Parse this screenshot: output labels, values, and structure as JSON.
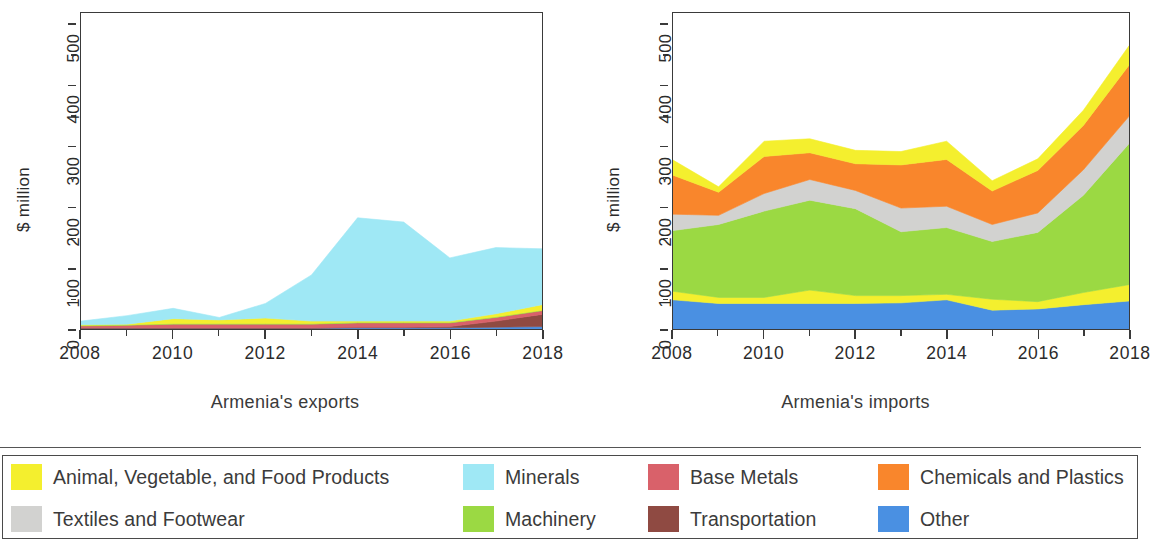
{
  "axis": {
    "ylabel": "$ million",
    "yticks": [
      "0",
      "100",
      "200",
      "300",
      "400",
      "500"
    ],
    "xticks": [
      "2008",
      "2010",
      "2012",
      "2014",
      "2016",
      "2018"
    ],
    "ylim": [
      0,
      520
    ],
    "xlim": [
      2008,
      2018
    ]
  },
  "panels": [
    {
      "id": "exports",
      "caption": "Armenia's exports"
    },
    {
      "id": "imports",
      "caption": "Armenia's imports"
    }
  ],
  "legend": {
    "items": [
      {
        "label": "Animal, Vegetable, and Food Products",
        "color": "#f4ef2e",
        "key": "food"
      },
      {
        "label": "Minerals",
        "color": "#9fe8f5",
        "key": "minerals"
      },
      {
        "label": "Base Metals",
        "color": "#d9616a",
        "key": "base_metals"
      },
      {
        "label": "Chemicals and Plastics",
        "color": "#f9862c",
        "key": "chemicals"
      },
      {
        "label": "Textiles and Footwear",
        "color": "#d2d2d0",
        "key": "textiles"
      },
      {
        "label": "Machinery",
        "color": "#9bd943",
        "key": "machinery"
      },
      {
        "label": "Transportation",
        "color": "#8f4a42",
        "key": "transportation"
      },
      {
        "label": "Other",
        "color": "#4a90e2",
        "key": "other"
      }
    ]
  },
  "chart_data": [
    {
      "type": "area",
      "title": "Armenia's exports",
      "stacked": true,
      "xlabel": "",
      "ylabel": "$ million",
      "ylim": [
        0,
        520
      ],
      "grid": false,
      "legend_position": "below-figure",
      "x": [
        2008,
        2009,
        2010,
        2011,
        2012,
        2013,
        2014,
        2015,
        2016,
        2017,
        2018
      ],
      "series": [
        {
          "name": "Other",
          "color": "#4a90e2",
          "values": [
            1,
            1,
            1,
            1,
            1,
            1,
            2,
            2,
            2,
            3,
            4
          ]
        },
        {
          "name": "Transportation",
          "color": "#8f4a42",
          "values": [
            1,
            1,
            1,
            1,
            1,
            1,
            1,
            1,
            2,
            10,
            20
          ]
        },
        {
          "name": "Base Metals",
          "color": "#d9616a",
          "values": [
            3,
            4,
            6,
            6,
            6,
            6,
            7,
            7,
            6,
            6,
            6
          ]
        },
        {
          "name": "Machinery",
          "color": "#9bd943",
          "values": [
            1,
            1,
            1,
            1,
            1,
            1,
            1,
            1,
            1,
            1,
            1
          ]
        },
        {
          "name": "Textiles and Footwear",
          "color": "#d2d2d0",
          "values": [
            0,
            0,
            0,
            0,
            0,
            0,
            0,
            0,
            0,
            0,
            0
          ]
        },
        {
          "name": "Animal, Vegetable, and Food Products",
          "color": "#f4ef2e",
          "values": [
            1,
            1,
            8,
            6,
            9,
            4,
            2,
            2,
            2,
            5,
            9
          ]
        },
        {
          "name": "Minerals",
          "color": "#9fe8f5",
          "values": [
            6,
            14,
            17,
            4,
            24,
            76,
            170,
            163,
            104,
            109,
            92
          ]
        }
      ],
      "totals": [
        13,
        22,
        34,
        19,
        42,
        89,
        183,
        176,
        117,
        134,
        132
      ]
    },
    {
      "type": "area",
      "title": "Armenia's imports",
      "stacked": true,
      "xlabel": "",
      "ylabel": "$ million",
      "ylim": [
        0,
        520
      ],
      "grid": false,
      "legend_position": "below-figure",
      "x": [
        2008,
        2009,
        2010,
        2011,
        2012,
        2013,
        2014,
        2015,
        2016,
        2017,
        2018
      ],
      "series": [
        {
          "name": "Other",
          "color": "#4a90e2",
          "values": [
            48,
            42,
            42,
            42,
            42,
            43,
            48,
            31,
            33,
            40,
            46
          ]
        },
        {
          "name": "Animal, Vegetable, and Food Products",
          "color": "#f4ef2e",
          "values": [
            14,
            10,
            10,
            22,
            13,
            12,
            9,
            18,
            12,
            20,
            27
          ]
        },
        {
          "name": "Machinery",
          "color": "#9bd943",
          "values": [
            100,
            120,
            142,
            148,
            143,
            105,
            110,
            95,
            114,
            160,
            232
          ]
        },
        {
          "name": "Textiles and Footwear",
          "color": "#d2d2d0",
          "values": [
            27,
            15,
            29,
            34,
            30,
            39,
            35,
            28,
            32,
            42,
            45
          ]
        },
        {
          "name": "Chemicals and Plastics",
          "color": "#f9862c",
          "values": [
            64,
            38,
            61,
            44,
            44,
            71,
            77,
            55,
            70,
            73,
            84
          ]
        },
        {
          "name": "Minerals",
          "color": "#9fe8f5",
          "values": [
            0,
            0,
            0,
            0,
            0,
            0,
            0,
            0,
            0,
            0,
            0
          ]
        },
        {
          "name": "Base Metals",
          "color": "#d9616a",
          "values": [
            0,
            0,
            0,
            0,
            0,
            0,
            0,
            0,
            0,
            0,
            0
          ]
        },
        {
          "name": "Transportation",
          "color": "#8f4a42",
          "values": [
            0,
            0,
            0,
            0,
            0,
            0,
            0,
            0,
            0,
            0,
            0
          ]
        },
        {
          "name": "Top band (Animal, Vegetable, and Food Products)",
          "color": "#f4ef2e",
          "values": [
            25,
            9,
            25,
            23,
            22,
            22,
            30,
            17,
            19,
            25,
            32
          ]
        }
      ],
      "totals": [
        278,
        234,
        309,
        313,
        294,
        292,
        309,
        244,
        280,
        360,
        466
      ]
    }
  ]
}
